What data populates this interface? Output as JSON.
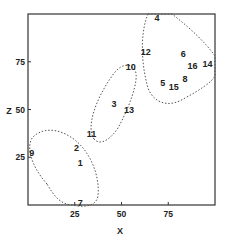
{
  "chart_data": {
    "type": "scatter",
    "title": "",
    "xlabel": "X",
    "ylabel": "Z",
    "xlim": [
      0,
      100
    ],
    "ylim": [
      0,
      100
    ],
    "grid": false,
    "x_ticks": [
      25,
      50,
      75
    ],
    "y_ticks": [
      25,
      50,
      75
    ],
    "points": [
      {
        "label": "1",
        "x": 28,
        "y": 22
      },
      {
        "label": "2",
        "x": 26,
        "y": 30
      },
      {
        "label": "3",
        "x": 46,
        "y": 53
      },
      {
        "label": "4",
        "x": 69,
        "y": 98
      },
      {
        "label": "5",
        "x": 72,
        "y": 64
      },
      {
        "label": "6",
        "x": 83,
        "y": 79
      },
      {
        "label": "7",
        "x": 28,
        "y": 1
      },
      {
        "label": "8",
        "x": 84,
        "y": 66
      },
      {
        "label": "9",
        "x": 2,
        "y": 27
      },
      {
        "label": "10",
        "x": 55,
        "y": 72
      },
      {
        "label": "11",
        "x": 34,
        "y": 37
      },
      {
        "label": "12",
        "x": 63,
        "y": 80
      },
      {
        "label": "13",
        "x": 54,
        "y": 50
      },
      {
        "label": "14",
        "x": 96,
        "y": 74
      },
      {
        "label": "15",
        "x": 78,
        "y": 62
      },
      {
        "label": "16",
        "x": 88,
        "y": 73
      }
    ],
    "clusters": [
      {
        "name": "cluster-lower-left",
        "members": [
          "1",
          "2",
          "7",
          "9"
        ]
      },
      {
        "name": "cluster-middle",
        "members": [
          "3",
          "10",
          "11",
          "13"
        ]
      },
      {
        "name": "cluster-upper-right",
        "members": [
          "4",
          "5",
          "6",
          "8",
          "12",
          "14",
          "15",
          "16"
        ]
      }
    ]
  },
  "axes": {
    "x_label": "X",
    "y_label": "Z",
    "x_tick_labels": [
      "25",
      "50",
      "75"
    ],
    "y_tick_labels": [
      "25",
      "50",
      "75"
    ]
  }
}
